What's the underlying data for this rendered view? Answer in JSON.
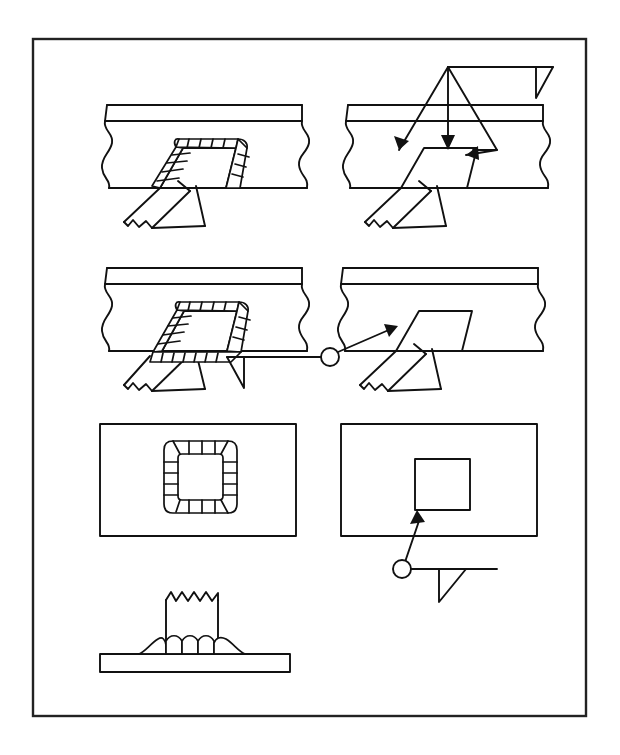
{
  "figure": {
    "border_color": "#222222",
    "line_color": "#111111",
    "background_color": "#ffffff",
    "panels": [
      {
        "id": "top-left",
        "name": "slot-weld-pictorial-partial",
        "description": "Pictorial view of a lap joint with a slot in the upper plate, weld bead deposited around three sides of the slot",
        "elements": [
          "upper-plate",
          "lower-plate",
          "slot-opening",
          "weld-bead-ripples",
          "hidden-edge-dashed",
          "break-line-left",
          "break-line-right"
        ]
      },
      {
        "id": "top-right",
        "name": "slot-weld-symbol-three-arrows",
        "description": "Same joint shown with a welding symbol: reference line with fillet weld triangle and three leader arrows pointing to the slot faces",
        "elements": [
          "reference-line",
          "fillet-weld-triangle",
          "leader-arrow-left",
          "leader-arrow-center",
          "leader-arrow-right",
          "slot-opening",
          "hidden-edge-dashed"
        ],
        "arrow_count": 3
      },
      {
        "id": "middle-left",
        "name": "slot-weld-pictorial-all-around",
        "description": "Pictorial view with weld bead deposited completely around all four sides of the slot",
        "elements": [
          "upper-plate",
          "lower-plate",
          "slot-opening",
          "weld-bead-ripples-all-around",
          "break-line-left",
          "break-line-right"
        ]
      },
      {
        "id": "middle-right",
        "name": "slot-weld-symbol-weld-all-around",
        "description": "Same joint with a single leader arrow and a weld-all-around circle at the reference line junction",
        "elements": [
          "reference-line",
          "fillet-weld-triangle",
          "weld-all-around-circle",
          "leader-arrow",
          "slot-opening",
          "hidden-edge-dashed"
        ],
        "arrow_count": 1
      },
      {
        "id": "bottom-left",
        "name": "slot-weld-plan-view-bead",
        "description": "Plan view of the plate showing the square slot encircled by a continuous weld bead",
        "elements": [
          "plate-outline-rectangle",
          "square-slot",
          "weld-bead-ring"
        ]
      },
      {
        "id": "bottom-right",
        "name": "slot-weld-plan-view-symbol",
        "description": "Plan view of the plate with a plain square slot and a welding symbol with weld-all-around circle",
        "elements": [
          "plate-outline-rectangle",
          "square-slot",
          "leader-arrow",
          "weld-all-around-circle",
          "reference-line",
          "fillet-weld-triangle"
        ]
      },
      {
        "id": "bottom-center",
        "name": "tee-joint-section-fillet",
        "description": "Sectional view of a tee joint: vertical member with jagged break line, joined to the horizontal base plate by a fillet weld bead",
        "elements": [
          "base-plate",
          "vertical-member",
          "break-line-jagged",
          "fillet-weld-bead"
        ]
      }
    ],
    "symbols": {
      "fillet_weld": "right-triangle below reference line",
      "weld_all_around": "open circle at junction of reference line and leader",
      "leader_arrow": "solid filled arrowhead",
      "hidden_line": "dashed line",
      "break_line": "freehand S-curve or jagged zigzag"
    }
  }
}
